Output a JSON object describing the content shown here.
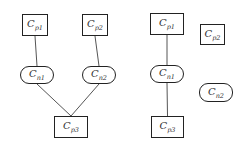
{
  "diagrams": [
    {
      "nodes": [
        {
          "id": "cp1",
          "label": "C",
          "sub": "p1",
          "shape": "rect",
          "x": 22,
          "y": 14,
          "w": 26,
          "h": 22
        },
        {
          "id": "cp2",
          "label": "C",
          "sub": "p2",
          "shape": "rect",
          "x": 82,
          "y": 14,
          "w": 26,
          "h": 22
        },
        {
          "id": "cn1",
          "label": "C",
          "sub": "n1",
          "shape": "pill",
          "x": 20,
          "y": 66,
          "w": 34,
          "h": 18
        },
        {
          "id": "cn2",
          "label": "C",
          "sub": "n2",
          "shape": "pill",
          "x": 82,
          "y": 66,
          "w": 34,
          "h": 18
        },
        {
          "id": "cp3",
          "label": "C",
          "sub": "p3",
          "shape": "rect",
          "x": 54,
          "y": 116,
          "w": 34,
          "h": 22
        }
      ],
      "edges": [
        [
          "cp1",
          "cn1"
        ],
        [
          "cp2",
          "cn2"
        ],
        [
          "cn1",
          "cp3"
        ],
        [
          "cn2",
          "cp3"
        ]
      ]
    },
    {
      "nodes": [
        {
          "id": "cp1",
          "label": "C",
          "sub": "p1",
          "shape": "rect",
          "x": 150,
          "y": 13,
          "w": 34,
          "h": 22
        },
        {
          "id": "cp2",
          "label": "C",
          "sub": "p2",
          "shape": "rect",
          "x": 200,
          "y": 24,
          "w": 25,
          "h": 21
        },
        {
          "id": "cn1",
          "label": "C",
          "sub": "n1",
          "shape": "pill",
          "x": 150,
          "y": 65,
          "w": 34,
          "h": 18
        },
        {
          "id": "cn2",
          "label": "C",
          "sub": "n2",
          "shape": "pill",
          "x": 199,
          "y": 83,
          "w": 34,
          "h": 19
        },
        {
          "id": "cp3",
          "label": "C",
          "sub": "p3",
          "shape": "rect",
          "x": 151,
          "y": 116,
          "w": 33,
          "h": 22
        }
      ],
      "edges": [
        [
          "cp1",
          "cn1"
        ],
        [
          "cn1",
          "cp3"
        ]
      ]
    }
  ]
}
